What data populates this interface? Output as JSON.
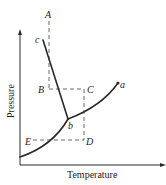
{
  "diagram": {
    "type": "phase-diagram",
    "axes": {
      "x_label": "Temperature",
      "y_label": "Pressure"
    },
    "curve_labels": {
      "a": "a",
      "b": "b",
      "c": "c"
    },
    "point_labels": {
      "A": "A",
      "B": "B",
      "C": "C",
      "D": "D",
      "E": "E"
    },
    "colors": {
      "line": "#2a2a2a",
      "dashed": "#444444",
      "background": "#ffffff"
    }
  }
}
